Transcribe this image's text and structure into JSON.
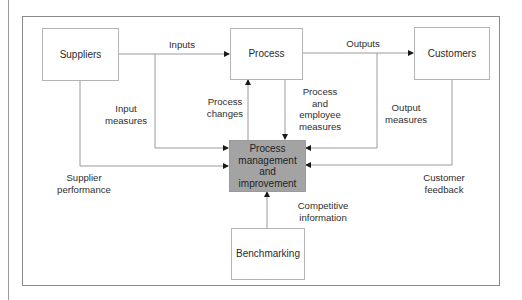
{
  "diagram": {
    "nodes": {
      "suppliers": "Suppliers",
      "process": "Process",
      "customers": "Customers",
      "pmi": [
        "Process",
        "management",
        "and",
        "improvement"
      ],
      "benchmarking": "Benchmarking"
    },
    "edges": {
      "inputs": "Inputs",
      "outputs": "Outputs",
      "input_measures": [
        "Input",
        "measures"
      ],
      "process_changes": [
        "Process",
        "changes"
      ],
      "process_employee_measures": [
        "Process",
        "and",
        "employee",
        "measures"
      ],
      "output_measures": [
        "Output",
        "measures"
      ],
      "supplier_performance": [
        "Supplier",
        "performance"
      ],
      "customer_feedback": [
        "Customer",
        "feedback"
      ],
      "competitive_information": [
        "Competitive",
        "information"
      ]
    },
    "colors": {
      "line": "#8c8c8c",
      "core_fill": "#a3a3a3",
      "box_border": "#b4b4b4"
    }
  }
}
